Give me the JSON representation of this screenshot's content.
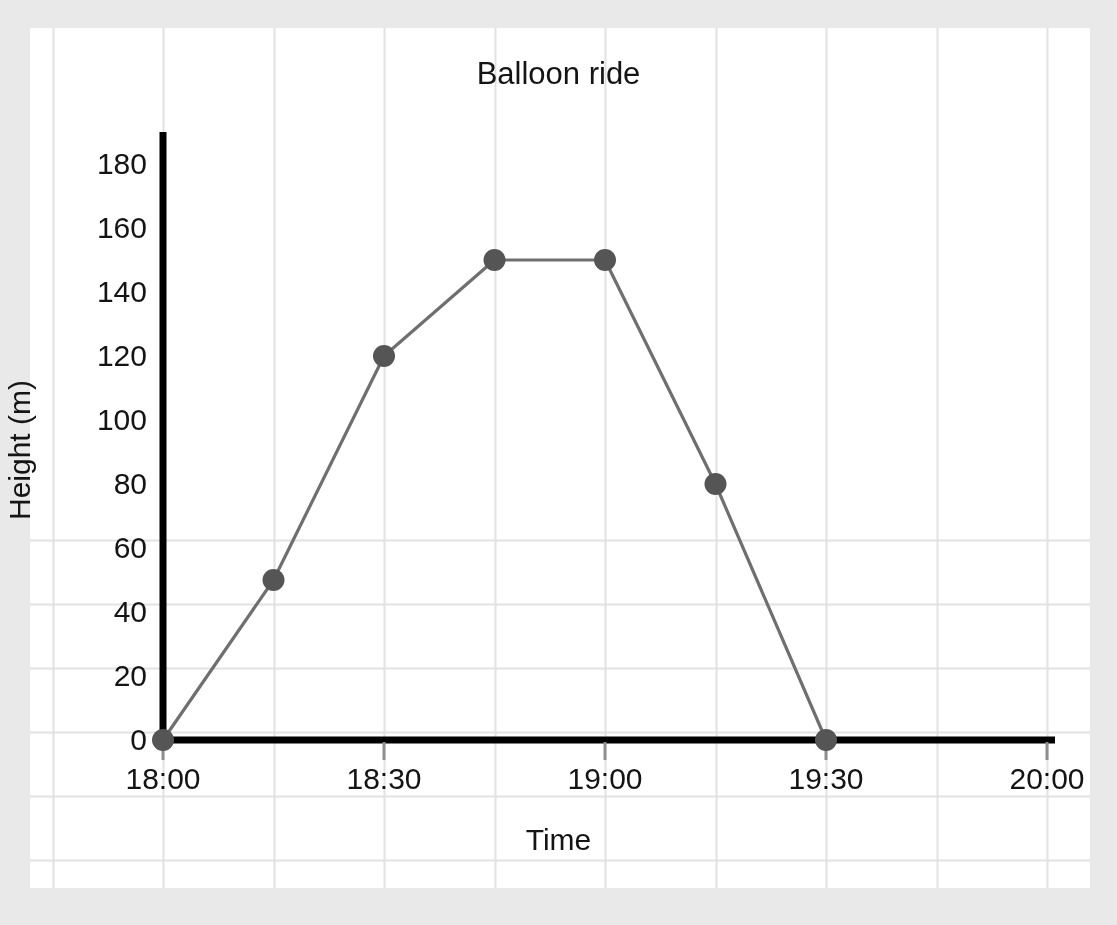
{
  "page": {
    "background_color": "#e9e9e9",
    "paper_color": "#ffffff",
    "clipped_top_text": ""
  },
  "chart_data": {
    "type": "line",
    "title": "Balloon ride",
    "xlabel": "Time",
    "ylabel": "Height (m)",
    "x": [
      "18:00",
      "18:15",
      "18:30",
      "18:45",
      "19:00",
      "19:15",
      "19:30"
    ],
    "values": [
      0,
      50,
      120,
      150,
      150,
      80,
      0
    ],
    "points": [
      {
        "time": "18:00",
        "height": 0
      },
      {
        "time": "18:15",
        "height": 50
      },
      {
        "time": "18:30",
        "height": 120
      },
      {
        "time": "18:45",
        "height": 150
      },
      {
        "time": "19:00",
        "height": 150
      },
      {
        "time": "19:15",
        "height": 80
      },
      {
        "time": "19:30",
        "height": 0
      }
    ],
    "xtick_labels": [
      "18:00",
      "18:30",
      "19:00",
      "19:30",
      "20:00"
    ],
    "xtick_values": [
      0,
      30,
      60,
      90,
      120
    ],
    "ytick_labels": [
      "0",
      "20",
      "40",
      "60",
      "80",
      "100",
      "120",
      "140",
      "160",
      "180"
    ],
    "ytick_values": [
      0,
      20,
      40,
      60,
      80,
      100,
      120,
      140,
      160,
      180
    ],
    "xlim": [
      0,
      120
    ],
    "ylim": [
      0,
      190
    ],
    "grid": true,
    "legend": "none",
    "line_color": "#6f6f6f",
    "marker_color": "#555555",
    "axis_color": "#000000",
    "grid_color": "#e2e2e2",
    "text_color": "#141414"
  }
}
